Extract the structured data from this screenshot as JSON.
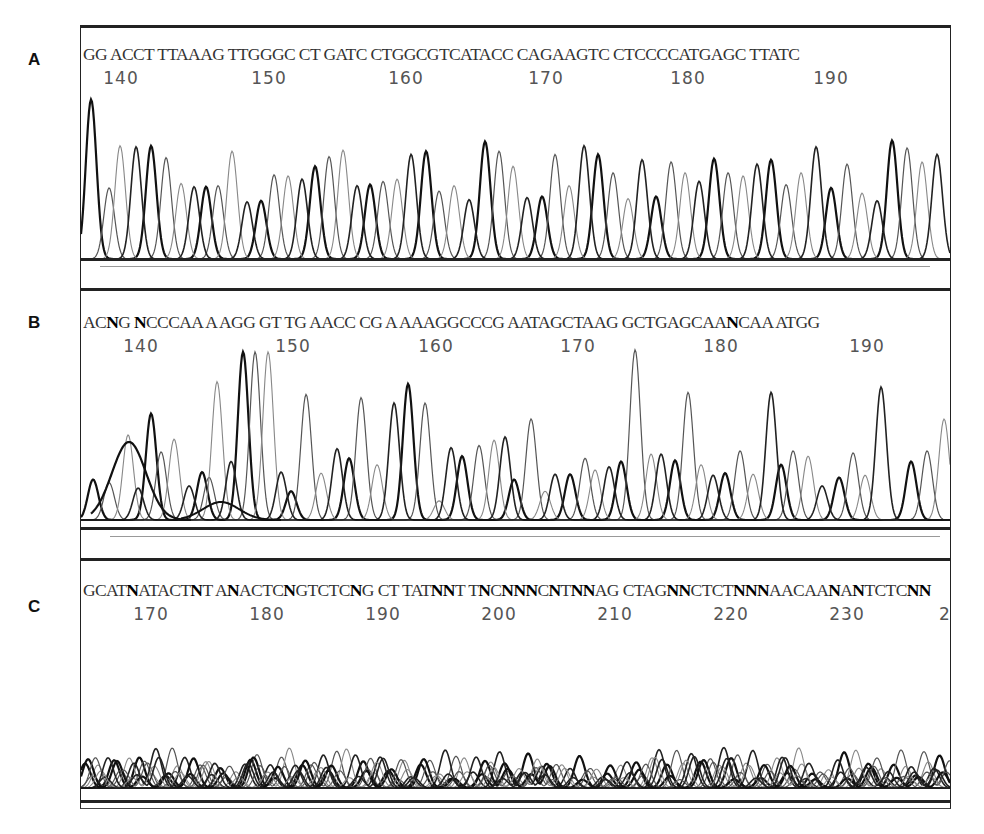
{
  "figure": {
    "panels": [
      {
        "id": "A",
        "label": "A",
        "sequence": "GG ACCTTTAAAG TTGGGCCTGATCCTGGCGTCATACC CAGAAGTCCTCCCCATGAGCTTATC",
        "sequence_display": [
          {
            "t": "GG AC",
            "b": false
          },
          {
            "t": "CT TTAAAG TTGGGC CT GATC CTG",
            "b": false
          },
          {
            "t": "GCG",
            "b": false
          },
          {
            "t": "TCATACC CAGAAGTC CTCCCCATGAGC TTATC",
            "b": false
          }
        ],
        "ticks": [
          {
            "label": "140",
            "x": 40
          },
          {
            "label": "150",
            "x": 188
          },
          {
            "label": "160",
            "x": 325
          },
          {
            "label": "170",
            "x": 465
          },
          {
            "label": "180",
            "x": 607
          },
          {
            "label": "190",
            "x": 750
          }
        ]
      },
      {
        "id": "B",
        "label": "B",
        "sequence_display": [
          {
            "t": "AC",
            "b": false
          },
          {
            "t": "N",
            "b": true
          },
          {
            "t": "G ",
            "b": false
          },
          {
            "t": "N",
            "b": true
          },
          {
            "t": "CCCAA A AGG GT TG AACC CG A AAAGGCCCG AATAGCTAAG GCTGAGCAA",
            "b": false
          },
          {
            "t": "N",
            "b": true
          },
          {
            "t": "CAA ATGG",
            "b": false
          }
        ],
        "ticks": [
          {
            "label": "140",
            "x": 60
          },
          {
            "label": "150",
            "x": 212
          },
          {
            "label": "160",
            "x": 355
          },
          {
            "label": "170",
            "x": 497
          },
          {
            "label": "180",
            "x": 640
          },
          {
            "label": "190",
            "x": 786
          }
        ]
      },
      {
        "id": "C",
        "label": "C",
        "sequence_display": [
          {
            "t": "GCAT",
            "b": false
          },
          {
            "t": "N",
            "b": true
          },
          {
            "t": "ATACT",
            "b": false
          },
          {
            "t": "N",
            "b": true
          },
          {
            "t": "T A",
            "b": false
          },
          {
            "t": "N",
            "b": true
          },
          {
            "t": "ACTC",
            "b": false
          },
          {
            "t": "N",
            "b": true
          },
          {
            "t": "GTCTC",
            "b": false
          },
          {
            "t": "N",
            "b": true
          },
          {
            "t": "G CT TAT",
            "b": false
          },
          {
            "t": "NN",
            "b": true
          },
          {
            "t": "T T",
            "b": false
          },
          {
            "t": "N",
            "b": true
          },
          {
            "t": "C",
            "b": false
          },
          {
            "t": "NNN",
            "b": true
          },
          {
            "t": "C",
            "b": false
          },
          {
            "t": "N",
            "b": true
          },
          {
            "t": "T",
            "b": false
          },
          {
            "t": "NN",
            "b": true
          },
          {
            "t": "AG CTAG",
            "b": false
          },
          {
            "t": "NN",
            "b": true
          },
          {
            "t": "CTCT",
            "b": false
          },
          {
            "t": "NNN",
            "b": true
          },
          {
            "t": "AACAA",
            "b": false
          },
          {
            "t": "N",
            "b": true
          },
          {
            "t": "A",
            "b": false
          },
          {
            "t": "N",
            "b": true
          },
          {
            "t": "TCTC",
            "b": false
          },
          {
            "t": "NN",
            "b": true
          }
        ],
        "ticks": [
          {
            "label": "170",
            "x": 70
          },
          {
            "label": "180",
            "x": 186
          },
          {
            "label": "190",
            "x": 302
          },
          {
            "label": "200",
            "x": 418
          },
          {
            "label": "210",
            "x": 534
          },
          {
            "label": "220",
            "x": 650
          },
          {
            "label": "230",
            "x": 766
          },
          {
            "label": "2",
            "x": 864
          }
        ]
      }
    ]
  },
  "chart_data": [
    {
      "type": "line",
      "title": "A",
      "xlabel": "Base position",
      "ylabel": "Fluorescence signal",
      "x_ticks": [
        140,
        150,
        160,
        170,
        180,
        190
      ],
      "base_calls": "GGACCTTTAAAGTTGGGCCTGATCCTGGCGTCATACCCAGAAGTCCTCCCCATGAGCTTATC",
      "description": "Clean, evenly spaced single peaks; high quality read",
      "peaks": {
        "x": [
          10,
          28,
          39,
          55,
          70,
          85,
          100,
          113,
          125,
          137,
          151,
          166,
          180,
          193,
          207,
          221,
          234,
          248,
          262,
          276,
          289,
          302,
          316,
          330,
          345,
          358,
          373,
          388,
          404,
          418,
          432,
          446,
          461,
          474,
          488,
          503,
          517,
          532,
          547,
          561,
          575,
          590,
          604,
          618,
          633,
          647,
          662,
          676,
          690,
          705,
          720,
          735,
          750,
          766,
          781,
          796,
          811,
          826,
          841,
          856
        ],
        "h": [
          148,
          66,
          105,
          104,
          105,
          94,
          70,
          67,
          67,
          68,
          100,
          53,
          54,
          78,
          77,
          74,
          86,
          95,
          101,
          68,
          69,
          72,
          74,
          97,
          100,
          63,
          68,
          55,
          109,
          100,
          86,
          57,
          58,
          97,
          68,
          105,
          97,
          80,
          56,
          92,
          58,
          90,
          80,
          72,
          93,
          80,
          77,
          88,
          92,
          69,
          80,
          104,
          66,
          88,
          61,
          54,
          110,
          103,
          90,
          97
        ]
      },
      "ylim": [
        0,
        160
      ]
    },
    {
      "type": "line",
      "title": "B",
      "xlabel": "Base position",
      "ylabel": "Fluorescence signal",
      "x_ticks": [
        140,
        150,
        160,
        170,
        180,
        190
      ],
      "base_calls": "ACNGNCCCAAAAGGGTTGAACCCGAAAAGGCCCGAATAGCTAAGGCTGAGCAANCAAATGG",
      "description": "Uneven peak heights, overlapping broad peaks and N calls; poor quality read",
      "peaks": {
        "x": [
          12,
          28,
          47,
          57,
          70,
          80,
          93,
          108,
          121,
          128,
          136,
          150,
          162,
          174,
          187,
          200,
          210,
          225,
          240,
          256,
          268,
          280,
          296,
          313,
          327,
          344,
          358,
          370,
          381,
          398,
          413,
          424,
          433,
          450,
          464,
          474,
          489,
          504,
          514,
          528,
          540,
          554,
          570,
          580,
          594,
          607,
          620,
          632,
          644,
          659,
          672,
          690,
          700,
          712,
          727,
          741,
          758,
          772,
          784,
          800,
          830,
          846,
          863
        ],
        "h": [
          38,
          35,
          80,
          30,
          100,
          64,
          76,
          32,
          45,
          40,
          130,
          55,
          158,
          158,
          158,
          45,
          27,
          118,
          44,
          67,
          58,
          115,
          52,
          110,
          128,
          110,
          18,
          68,
          60,
          70,
          75,
          78,
          38,
          95,
          27,
          43,
          43,
          58,
          47,
          50,
          55,
          160,
          62,
          62,
          56,
          120,
          52,
          42,
          44,
          65,
          43,
          120,
          52,
          65,
          60,
          32,
          40,
          63,
          42,
          125,
          55,
          65,
          95
        ]
      },
      "ylim": [
        0,
        165
      ]
    },
    {
      "type": "line",
      "title": "C",
      "xlabel": "Base position",
      "ylabel": "Fluorescence signal",
      "x_ticks": [
        170,
        180,
        190,
        200,
        210,
        220,
        230
      ],
      "base_calls": "GCATNATACTNTANACTCNGTCTCNGCTTATNNTTNCNNNCNTNNAGCTAGNNCTCTNNNAACAANANTCTCNN",
      "description": "Low-amplitude, overlapping noisy peaks throughout; failed read",
      "noise": {
        "max_h": 40,
        "min_h": 8,
        "spacing": 7
      }
    }
  ]
}
